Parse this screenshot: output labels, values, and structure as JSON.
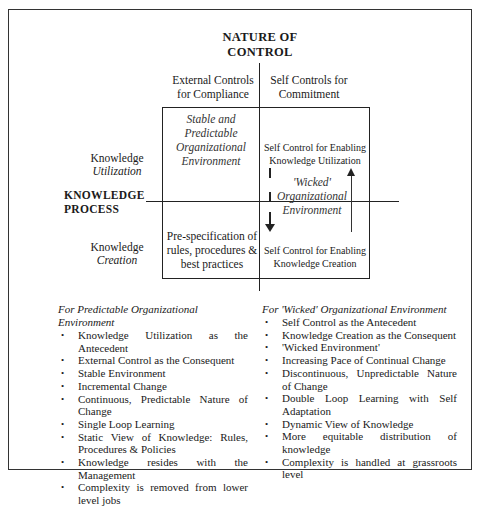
{
  "diagram": {
    "title_line1": "NATURE OF",
    "title_line2": "CONTROL",
    "columns": [
      {
        "line1": "External Controls",
        "line2": "for Compliance"
      },
      {
        "line1": "Self Controls for",
        "line2": "Commitment"
      }
    ],
    "rows": [
      {
        "line1": "Knowledge",
        "line2": "Utilization"
      },
      {
        "line1": "Knowledge",
        "line2": "Creation"
      }
    ],
    "row_axis_label_line1": "KNOWLEDGE",
    "row_axis_label_line2": "PROCESS",
    "quadrants": {
      "top_left": {
        "line1": "Stable and",
        "line2": "Predictable",
        "line3": "Organizational",
        "line4": "Environment"
      },
      "top_right": {
        "line1": "Self Control for Enabling",
        "line2": "Knowledge Utilization"
      },
      "bottom_left": {
        "line1": "Pre-specification of",
        "line2": "rules, procedures &",
        "line3": "best practices"
      },
      "bottom_right": {
        "line1": "Self Control for Enabling",
        "line2": "Knowledge Creation"
      }
    },
    "center_right_label": {
      "line1": "'Wicked'",
      "line2": "Organizational",
      "line3": "Environment"
    },
    "arrows": [
      {
        "direction": "down",
        "meaning": "utilization-to-creation"
      },
      {
        "direction": "up",
        "meaning": "creation-to-utilization"
      }
    ]
  },
  "lists": {
    "left": {
      "title": "For Predictable Organizational Environment",
      "items": [
        "Knowledge Utilization as the Antecedent",
        "External Control as the Consequent",
        "Stable Environment",
        "Incremental Change",
        "Continuous, Predictable Nature of Change",
        "Single Loop Learning",
        "Static View of Knowledge: Rules, Procedures & Policies",
        "Knowledge resides with the Management",
        "Complexity is removed from lower level jobs"
      ]
    },
    "right": {
      "title": "For 'Wicked' Organizational Environment",
      "items": [
        "Self Control as the Antecedent",
        "Knowledge Creation as the Consequent",
        "'Wicked Environment'",
        "Increasing Pace of Continual Change",
        "Discontinuous, Unpredictable Nature of Change",
        "Double Loop Learning with Self Adaptation",
        "Dynamic View of Knowledge",
        "More equitable distribution of knowledge",
        "Complexity is handled at grassroots level"
      ]
    }
  }
}
